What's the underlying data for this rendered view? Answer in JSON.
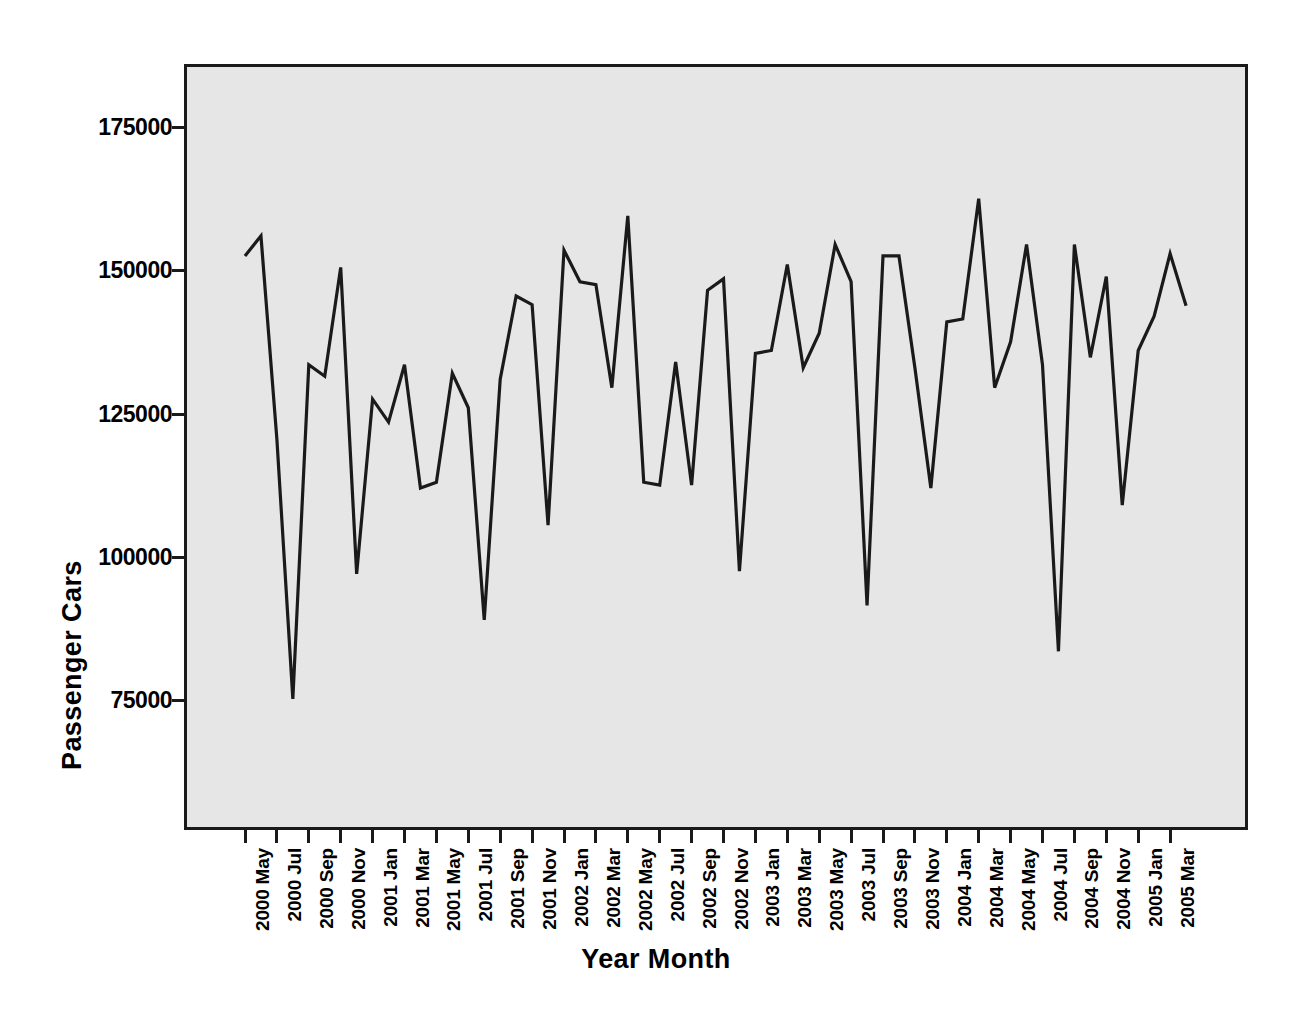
{
  "chart_data": {
    "type": "line",
    "title": "",
    "xlabel": "Year Month",
    "ylabel": "Passenger Cars",
    "ylim": [
      63000,
      185000
    ],
    "yticks": [
      75000,
      100000,
      125000,
      150000,
      175000
    ],
    "ytick_labels": [
      "75000",
      "100000",
      "125000",
      "150000",
      "175000"
    ],
    "grid": false,
    "legend": "none",
    "series_name": "Passenger Cars",
    "line_color": "#1a1a1a",
    "plot_background": "#e6e6e6",
    "frame_color": "#1a1a1a",
    "x": [
      "2000 May",
      "2000 Jun",
      "2000 Jul",
      "2000 Aug",
      "2000 Sep",
      "2000 Oct",
      "2000 Nov",
      "2000 Dec",
      "2001 Jan",
      "2001 Feb",
      "2001 Mar",
      "2001 Apr",
      "2001 May",
      "2001 Jun",
      "2001 Jul",
      "2001 Aug",
      "2001 Sep",
      "2001 Oct",
      "2001 Nov",
      "2001 Dec",
      "2002 Jan",
      "2002 Feb",
      "2002 Mar",
      "2002 Apr",
      "2002 May",
      "2002 Jun",
      "2002 Jul",
      "2002 Aug",
      "2002 Sep",
      "2002 Oct",
      "2002 Nov",
      "2002 Dec",
      "2003 Jan",
      "2003 Feb",
      "2003 Mar",
      "2003 Apr",
      "2003 May",
      "2003 Jun",
      "2003 Jul",
      "2003 Aug",
      "2003 Sep",
      "2003 Oct",
      "2003 Nov",
      "2003 Dec",
      "2004 Jan",
      "2004 Feb",
      "2004 Mar",
      "2004 Apr",
      "2004 May",
      "2004 Jun",
      "2004 Jul",
      "2004 Aug",
      "2004 Sep",
      "2004 Oct",
      "2004 Nov",
      "2004 Dec",
      "2005 Jan",
      "2005 Feb",
      "2005 Mar",
      "2005 Apr"
    ],
    "values": [
      152500,
      156000,
      120500,
      75200,
      133500,
      131500,
      150500,
      97000,
      127500,
      123500,
      133500,
      112000,
      113000,
      132000,
      126000,
      89000,
      131000,
      145500,
      144000,
      105500,
      153500,
      148000,
      147500,
      129500,
      159500,
      113000,
      112500,
      134000,
      112500,
      146500,
      148500,
      97500,
      135500,
      136000,
      151000,
      133000,
      139000,
      154500,
      148000,
      91500,
      152500,
      152500,
      133000,
      112000,
      141000,
      141500,
      162500,
      129500,
      137500,
      154500,
      133500,
      83500,
      154500,
      134800,
      148900,
      109000,
      136000,
      142000,
      152900,
      143800
    ],
    "xtick_labels": [
      "2000 May",
      "2000 Jul",
      "2000 Sep",
      "2000 Nov",
      "2001 Jan",
      "2001 Mar",
      "2001 May",
      "2001 Jul",
      "2001 Sep",
      "2001 Nov",
      "2002 Jan",
      "2002 Mar",
      "2002 May",
      "2002 Jul",
      "2002 Sep",
      "2002 Nov",
      "2003 Jan",
      "2003 Mar",
      "2003 May",
      "2003 Jul",
      "2003 Sep",
      "2003 Nov",
      "2004 Jan",
      "2004 Mar",
      "2004 May",
      "2004 Jul",
      "2004 Sep",
      "2004 Nov",
      "2005 Jan",
      "2005 Mar"
    ]
  },
  "axes": {
    "y_title": "Passenger Cars",
    "x_title": "Year Month"
  }
}
